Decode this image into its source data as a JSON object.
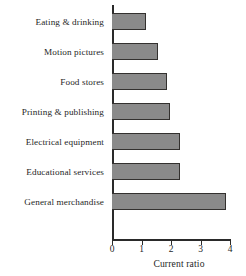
{
  "chart_data": {
    "type": "bar",
    "orientation": "horizontal",
    "title": "",
    "xlabel": "Current ratio",
    "ylabel": "",
    "categories": [
      "Eating & drinking",
      "Motion pictures",
      "Food stores",
      "Printing & publishing",
      "Electrical equipment",
      "Educational services",
      "General merchandise"
    ],
    "values": [
      1.15,
      1.55,
      1.85,
      1.95,
      2.3,
      2.3,
      3.85
    ],
    "xlim": [
      0,
      4
    ],
    "xticks": [
      0,
      1,
      2,
      3,
      4
    ],
    "xtick_labels": [
      "0",
      "1",
      "2",
      "3",
      "4"
    ],
    "grid": false,
    "legend": null,
    "bar_fill_color": "#8a8a8a",
    "bar_edge_color": "#33312f",
    "axis_color": "#2a2a2a"
  }
}
